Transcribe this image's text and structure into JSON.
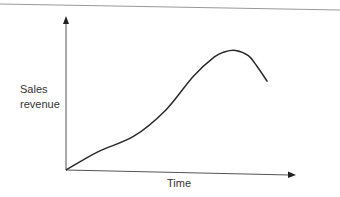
{
  "chart_data": {
    "type": "line",
    "title": "",
    "xlabel": "Time",
    "ylabel_lines": [
      "Sales",
      "revenue"
    ],
    "x_ticks": [],
    "y_ticks": [],
    "grid": false,
    "legend": "none",
    "xlim": [
      0,
      100
    ],
    "ylim": [
      0,
      100
    ],
    "series": [
      {
        "name": "Sales revenue",
        "color": "#2a2a2a",
        "x": [
          0,
          15,
          32,
          47,
          60,
          70,
          75,
          80,
          86,
          90,
          95
        ],
        "y": [
          0,
          14,
          26,
          46,
          72,
          87,
          91,
          92,
          88,
          80,
          68
        ]
      }
    ]
  },
  "colors": {
    "axis": "#444444",
    "rule": "#999999"
  }
}
